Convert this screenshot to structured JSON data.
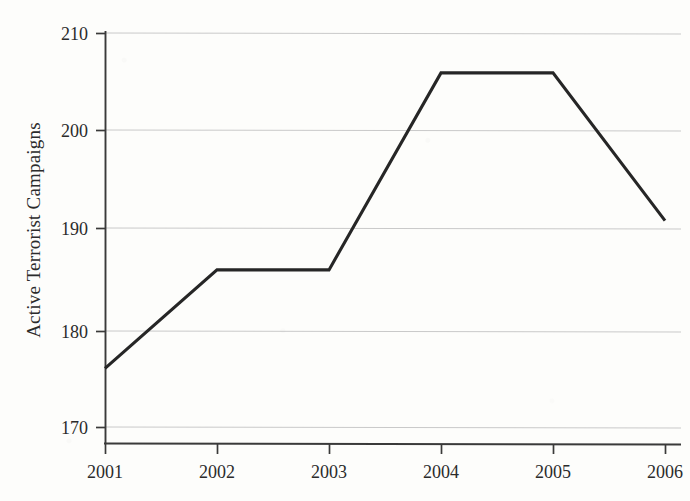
{
  "chart_data": {
    "type": "line",
    "title": "",
    "xlabel": "",
    "ylabel": "Active Terrorist Campaigns",
    "categories": [
      "2001",
      "2002",
      "2003",
      "2004",
      "2005",
      "2006"
    ],
    "x": [
      2001,
      2002,
      2003,
      2004,
      2005,
      2006
    ],
    "values": [
      176,
      186,
      186,
      206,
      206,
      191
    ],
    "series": [
      {
        "name": "Active Terrorist Campaigns",
        "values": [
          176,
          186,
          186,
          206,
          206,
          191
        ]
      }
    ],
    "ylim": [
      170,
      210
    ],
    "xlim": [
      2001,
      2006
    ],
    "yticks": [
      170,
      180,
      190,
      200,
      210
    ],
    "ytick_labels": [
      "170",
      "180",
      "190",
      "200",
      "210"
    ],
    "xticks": [
      2001,
      2002,
      2003,
      2004,
      2005,
      2006
    ],
    "xtick_labels": [
      "2001",
      "2002",
      "2003",
      "2004",
      "2005",
      "2006"
    ],
    "grid": "horizontal",
    "legend": "none",
    "line_color": "#262626",
    "grid_color": "#c9c9c9",
    "axis_color": "#3a3a3a",
    "background_color": "#fdfdfb",
    "annotations": []
  },
  "axes": {
    "y_axis_title": "Active Terrorist Campaigns",
    "y_tick_0": "170",
    "y_tick_1": "180",
    "y_tick_2": "190",
    "y_tick_3": "200",
    "y_tick_4": "210",
    "x_tick_0": "2001",
    "x_tick_1": "2002",
    "x_tick_2": "2003",
    "x_tick_3": "2004",
    "x_tick_4": "2005",
    "x_tick_5": "2006"
  }
}
